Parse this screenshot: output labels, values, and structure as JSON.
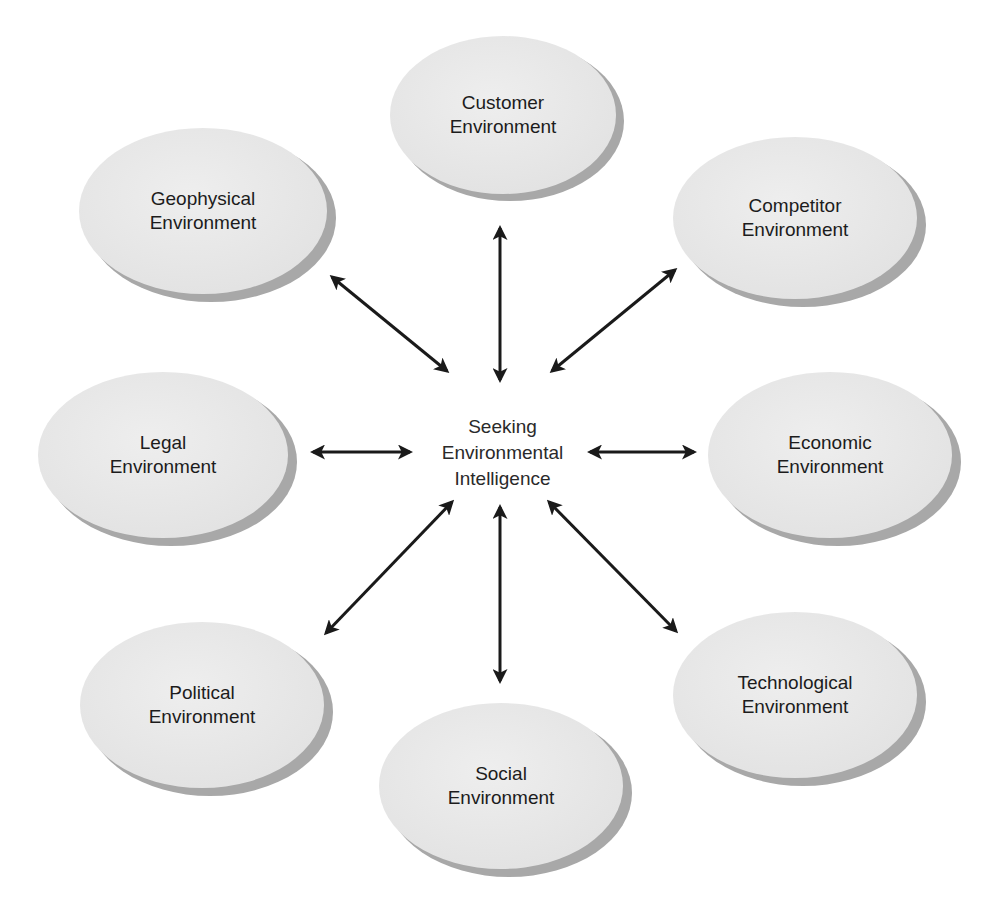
{
  "diagram": {
    "center": {
      "line1": "Seeking",
      "line2": "Environmental",
      "line3": "Intelligence"
    },
    "nodes": [
      {
        "id": "customer",
        "line1": "Customer",
        "line2": "Environment"
      },
      {
        "id": "competitor",
        "line1": "Competitor",
        "line2": "Environment"
      },
      {
        "id": "economic",
        "line1": "Economic",
        "line2": "Environment"
      },
      {
        "id": "technological",
        "line1": "Technological",
        "line2": "Environment"
      },
      {
        "id": "social",
        "line1": "Social",
        "line2": "Environment"
      },
      {
        "id": "political",
        "line1": "Political",
        "line2": "Environment"
      },
      {
        "id": "legal",
        "line1": "Legal",
        "line2": "Environment"
      },
      {
        "id": "geophysical",
        "line1": "Geophysical",
        "line2": "Environment"
      }
    ],
    "connector": "double-headed-arrow",
    "colors": {
      "ellipse_fill": "#e9e9e9",
      "ellipse_shadow": "#a8a8a8",
      "arrow": "#1a1a1a",
      "text": "#1c1c1c",
      "background": "#ffffff"
    }
  }
}
